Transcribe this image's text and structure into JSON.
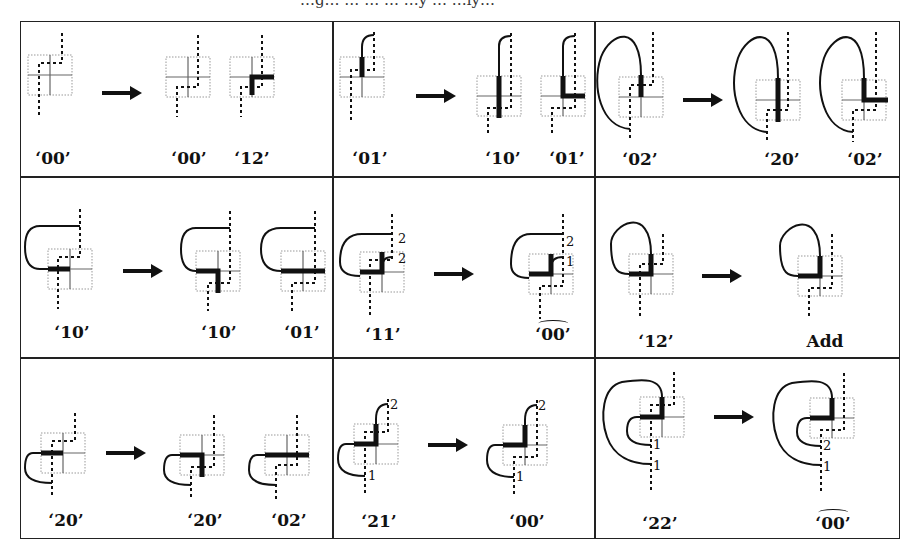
{
  "figure": {
    "title_fragment": "…g… … … … …y … …ly…",
    "cells": [
      {
        "id": "r1c1",
        "row": 1,
        "col": 1,
        "labels": [
          {
            "text": "‘00’",
            "hat": false
          },
          {
            "text": "‘00’",
            "hat": false
          },
          {
            "text": "‘12’",
            "hat": false
          }
        ]
      },
      {
        "id": "r1c2",
        "row": 1,
        "col": 2,
        "labels": [
          {
            "text": "‘01’",
            "hat": false
          },
          {
            "text": "‘10’",
            "hat": false
          },
          {
            "text": "‘01’",
            "hat": false
          }
        ]
      },
      {
        "id": "r1c3",
        "row": 1,
        "col": 3,
        "labels": [
          {
            "text": "‘02’",
            "hat": false
          },
          {
            "text": "‘20’",
            "hat": false
          },
          {
            "text": "‘02’",
            "hat": false
          }
        ]
      },
      {
        "id": "r2c1",
        "row": 2,
        "col": 1,
        "labels": [
          {
            "text": "‘10’",
            "hat": false
          },
          {
            "text": "‘10’",
            "hat": false
          },
          {
            "text": "‘01’",
            "hat": false
          }
        ]
      },
      {
        "id": "r2c2",
        "row": 2,
        "col": 2,
        "labels": [
          {
            "text": "‘11’",
            "hat": false
          },
          {
            "text": "‘00’",
            "hat": true
          }
        ],
        "annotations": [
          "2",
          "2",
          "2",
          "1"
        ]
      },
      {
        "id": "r2c3",
        "row": 2,
        "col": 3,
        "labels": [
          {
            "text": "‘12’",
            "hat": false
          },
          {
            "text": "Add",
            "hat": false
          }
        ]
      },
      {
        "id": "r3c1",
        "row": 3,
        "col": 1,
        "labels": [
          {
            "text": "‘20’",
            "hat": false
          },
          {
            "text": "‘20’",
            "hat": false
          },
          {
            "text": "‘02’",
            "hat": false
          }
        ]
      },
      {
        "id": "r3c2",
        "row": 3,
        "col": 2,
        "labels": [
          {
            "text": "‘21’",
            "hat": false
          },
          {
            "text": "‘00’",
            "hat": false
          }
        ],
        "annotations": [
          "2",
          "1",
          "2",
          "1"
        ]
      },
      {
        "id": "r3c3",
        "row": 3,
        "col": 3,
        "labels": [
          {
            "text": "‘22’",
            "hat": false
          },
          {
            "text": "‘00’",
            "hat": true
          }
        ],
        "annotations": [
          "1",
          "1",
          "2",
          "1"
        ]
      }
    ],
    "arrow_glyph": "right-arrow",
    "colors": {
      "ink": "#111111",
      "grid_dotted": "#888888",
      "thin_cross": "#666666",
      "border": "#222222"
    }
  }
}
